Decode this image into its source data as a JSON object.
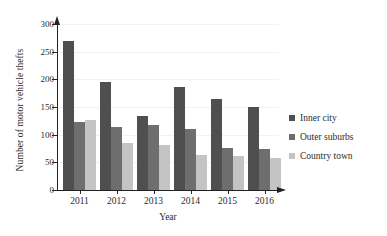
{
  "chart_data": {
    "type": "bar",
    "title": "",
    "subtitle": "",
    "xlabel": "Year",
    "ylabel": "Number of motor vehicle thefts",
    "categories": [
      "2011",
      "2012",
      "2013",
      "2014",
      "2015",
      "2016"
    ],
    "series": [
      {
        "name": "Inner city",
        "values": [
          270,
          196,
          134,
          187,
          164,
          150
        ],
        "color": "#4f4f4f"
      },
      {
        "name": "Outer suburbs",
        "values": [
          123,
          113,
          118,
          110,
          76,
          74
        ],
        "color": "#6e6e6e"
      },
      {
        "name": "Country town",
        "values": [
          126,
          85,
          82,
          64,
          62,
          57
        ],
        "color": "#c4c4c4"
      }
    ],
    "ylim": [
      0,
      300
    ],
    "y_ticks": [
      0,
      50,
      100,
      150,
      200,
      250,
      300
    ],
    "y_tick_labels": [
      "0",
      "50",
      "100",
      "150",
      "200",
      "250",
      "300"
    ],
    "grid": "faint-horizontal",
    "legend_position": "right",
    "axis_style": "arrow-tipped"
  },
  "legend": {
    "entries": [
      {
        "label": "Inner city",
        "swatch_color": "#4f4f4f"
      },
      {
        "label": "Outer suburbs",
        "swatch_color": "#6e6e6e"
      },
      {
        "label": "Country town",
        "swatch_color": "#c4c4c4"
      }
    ]
  },
  "colors": {
    "axis": "#222222",
    "text": "#2b2b2b",
    "background": "#ffffff",
    "gridline": "#f2f2f2"
  }
}
